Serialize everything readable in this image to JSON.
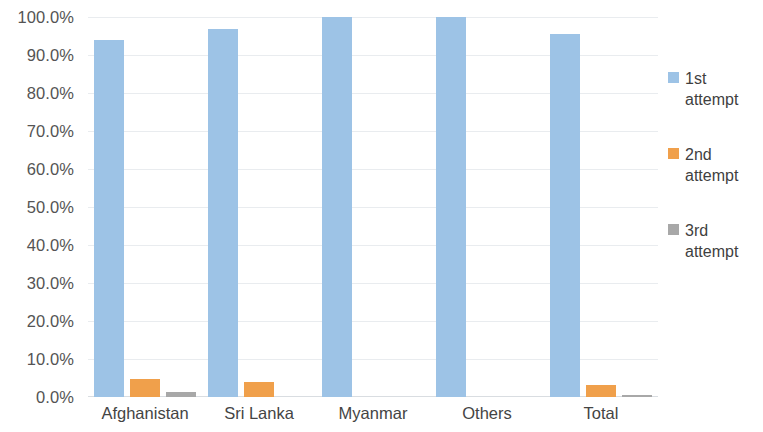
{
  "chart_data": {
    "type": "bar",
    "title": "",
    "subtitle": "",
    "xlabel": "",
    "ylabel": "",
    "ylim": [
      0,
      100
    ],
    "ytick_step": 10,
    "grid": true,
    "legend_position": "right",
    "categories": [
      "Afghanistan",
      "Sri Lanka",
      "Myanmar",
      "Others",
      "Total"
    ],
    "ytick_labels": [
      "100.0%",
      "90.0%",
      "80.0%",
      "70.0%",
      "60.0%",
      "50.0%",
      "40.0%",
      "30.0%",
      "20.0%",
      "10.0%",
      "0.0%"
    ],
    "ytick_values": [
      100,
      90,
      80,
      70,
      60,
      50,
      40,
      30,
      20,
      10,
      0
    ],
    "series": [
      {
        "name": "1st attempt",
        "label_line1": "1st",
        "label_line2": "attempt",
        "color": "#9dc3e6",
        "values": [
          93.9,
          96.8,
          100.0,
          100.0,
          95.5
        ]
      },
      {
        "name": "2nd attempt",
        "label_line1": "2nd",
        "label_line2": "attempt",
        "color": "#f0a04b",
        "values": [
          4.7,
          4.0,
          0.0,
          0.0,
          3.2
        ]
      },
      {
        "name": "3rd attempt",
        "label_line1": "3rd",
        "label_line2": "attempt",
        "color": "#a8a8a8",
        "values": [
          1.3,
          0.0,
          0.0,
          0.0,
          0.3
        ]
      }
    ]
  }
}
